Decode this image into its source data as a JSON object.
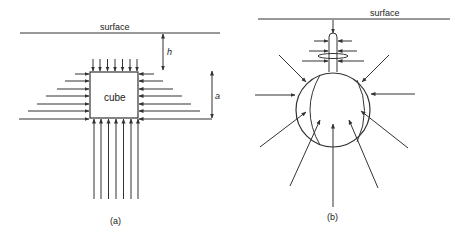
{
  "panel_a": {
    "surface_label": "surface",
    "depth_label": "h",
    "side_label": "a",
    "object_label": "cube",
    "caption": "(a)",
    "top_arrow_count": 7,
    "side_arrow_count": 7,
    "bottom_arrow_count": 7
  },
  "panel_b": {
    "surface_label": "surface",
    "caption": "(b)",
    "object": "sphere"
  },
  "colors": {
    "stroke": "#333333",
    "background": "#ffffff"
  }
}
